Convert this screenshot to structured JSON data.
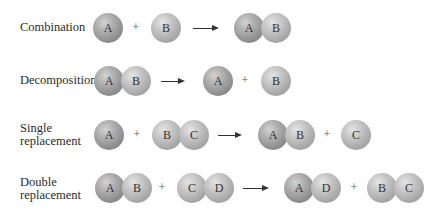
{
  "rows": [
    {
      "label": "Combination",
      "reactants": [
        [
          "A"
        ],
        [
          "B"
        ]
      ],
      "products": [
        [
          "A",
          "B"
        ]
      ]
    },
    {
      "label": "Decomposition",
      "reactants": [
        [
          "A",
          "B"
        ]
      ],
      "products": [
        [
          "A"
        ],
        [
          "B"
        ]
      ]
    },
    {
      "label_line1": "Single",
      "label_line2": "replacement",
      "reactants": [
        [
          "A"
        ],
        [
          "B",
          "C"
        ]
      ],
      "products": [
        [
          "A",
          "B"
        ],
        [
          "C"
        ]
      ]
    },
    {
      "label_line1": "Double",
      "label_line2": "replacement",
      "reactants": [
        [
          "A",
          "B"
        ],
        [
          "C",
          "D"
        ]
      ],
      "products": [
        [
          "A",
          "D"
        ],
        [
          "B",
          "C"
        ]
      ]
    }
  ],
  "symbols": {
    "plus": "+",
    "arrow": "arrow-right"
  },
  "colors": {
    "atom_A": "#8c8c8c",
    "atom_other": "#a6a6a6",
    "text": "#2b2b2b"
  }
}
